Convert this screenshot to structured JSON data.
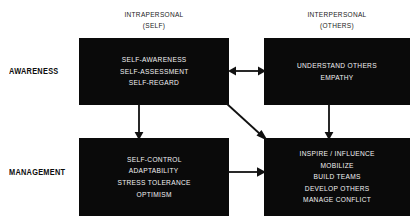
{
  "diagram": {
    "type": "2x2-matrix",
    "columns": [
      {
        "id": "intrapersonal",
        "line1": "INTRAPERSONAL",
        "line2": "(SELF)"
      },
      {
        "id": "interpersonal",
        "line1": "INTERPERSONAL",
        "line2": "(OTHERS)"
      }
    ],
    "rows": [
      {
        "id": "awareness",
        "label": "AWARENESS"
      },
      {
        "id": "management",
        "label": "MANAGEMENT"
      }
    ],
    "cells": {
      "self_awareness": {
        "row": "AWARENESS",
        "column": "INTRAPERSONAL (SELF)",
        "items": [
          "SELF-AWARENESS",
          "SELF-ASSESSMENT",
          "SELF-REGARD"
        ]
      },
      "other_awareness": {
        "row": "AWARENESS",
        "column": "INTERPERSONAL (OTHERS)",
        "items": [
          "UNDERSTAND OTHERS",
          "EMPATHY"
        ]
      },
      "self_management": {
        "row": "MANAGEMENT",
        "column": "INTRAPERSONAL (SELF)",
        "items": [
          "SELF-CONTROL",
          "ADAPTABILITY",
          "STRESS TOLERANCE",
          "OPTIMISM"
        ]
      },
      "relationship_management": {
        "row": "MANAGEMENT",
        "column": "INTERPERSONAL (OTHERS)",
        "items": [
          "INSPIRE / INFLUENCE",
          "MOBILIZE",
          "BUILD TEAMS",
          "DEVELOP OTHERS",
          "MANAGE CONFLICT"
        ]
      }
    },
    "arrows": [
      {
        "id": "awareness-horizontal",
        "from": "self_awareness",
        "to": "other_awareness",
        "style": "double-headed",
        "direction": "horizontal"
      },
      {
        "id": "self-vertical",
        "from": "self_awareness",
        "to": "self_management",
        "style": "single-headed",
        "direction": "down"
      },
      {
        "id": "other-vertical",
        "from": "other_awareness",
        "to": "relationship_management",
        "style": "single-headed",
        "direction": "down"
      },
      {
        "id": "diagonal-cross",
        "from": "self_awareness",
        "to": "relationship_management",
        "style": "single-headed",
        "direction": "diagonal-down-right"
      },
      {
        "id": "management-horizontal",
        "from": "self_management",
        "to": "relationship_management",
        "style": "single-headed",
        "direction": "right"
      }
    ],
    "colors": {
      "box_fill": "#0a0a0a",
      "box_text": "#f2f2f2",
      "label_text": "#0d0d0d",
      "arrow": "#111111",
      "background": "#ffffff"
    }
  }
}
